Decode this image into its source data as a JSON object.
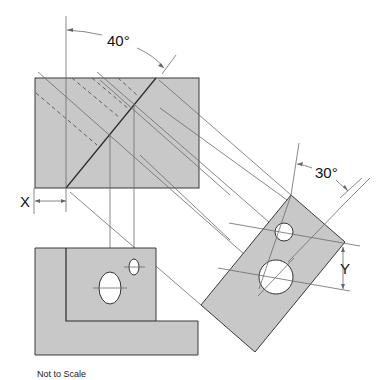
{
  "drawing": {
    "type": "orthographic projection with auxiliary view",
    "labels": {
      "angle_top": "40°",
      "angle_aux": "30°",
      "dim_x": "X",
      "dim_y": "Y",
      "note": "Not to Scale"
    },
    "colors": {
      "part_fill": "#c8c8c8",
      "outline": "#3a3a3a",
      "projection_line": "#6a6a6a",
      "hole": "#ffffff"
    },
    "views": {
      "top_view": {
        "x": 35,
        "y": 78,
        "width": 164,
        "height": 110
      },
      "front_view": {
        "x": 35,
        "y": 248,
        "width": 163,
        "height": 107
      },
      "auxiliary_view": {
        "vertices": [
          [
            291,
            195
          ],
          [
            345,
            242
          ],
          [
            255,
            352
          ],
          [
            201,
            305
          ]
        ]
      }
    }
  }
}
